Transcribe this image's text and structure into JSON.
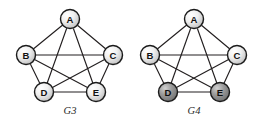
{
  "figure": {
    "background_color": "#ffffff",
    "edge_color": "#231f20",
    "node_outline_color": "#1a1a1a",
    "node_fill_light": "#f2f2f2",
    "node_fill_dark": "#8c8c8c",
    "node_highlight_color": "#ffffff"
  },
  "graphs": [
    {
      "id": "g3",
      "caption": "G3",
      "node_labels": [
        "A",
        "B",
        "C",
        "D",
        "E"
      ],
      "nodes": [
        {
          "id": "A",
          "label": "A",
          "cx": 70,
          "cy": 19,
          "r": 9.5,
          "shade": "light"
        },
        {
          "id": "B",
          "label": "B",
          "cx": 26,
          "cy": 55,
          "r": 9.5,
          "shade": "light"
        },
        {
          "id": "C",
          "label": "C",
          "cx": 113,
          "cy": 55,
          "r": 9.5,
          "shade": "light"
        },
        {
          "id": "D",
          "label": "D",
          "cx": 44,
          "cy": 92,
          "r": 9.5,
          "shade": "light"
        },
        {
          "id": "E",
          "label": "E",
          "cx": 96,
          "cy": 92,
          "r": 9.5,
          "shade": "light"
        }
      ],
      "edges": [
        {
          "from": "A",
          "to": "B"
        },
        {
          "from": "A",
          "to": "C"
        },
        {
          "from": "A",
          "to": "D"
        },
        {
          "from": "A",
          "to": "E"
        },
        {
          "from": "B",
          "to": "C"
        },
        {
          "from": "B",
          "to": "D"
        },
        {
          "from": "B",
          "to": "E"
        },
        {
          "from": "C",
          "to": "D"
        },
        {
          "from": "C",
          "to": "E"
        },
        {
          "from": "D",
          "to": "E"
        }
      ],
      "edge_count": 10,
      "caption_x": 70,
      "caption_y": 110
    },
    {
      "id": "g4",
      "caption": "G4",
      "node_labels": [
        "A",
        "B",
        "C",
        "D",
        "E"
      ],
      "nodes": [
        {
          "id": "A",
          "label": "A",
          "cx": 63,
          "cy": 19,
          "r": 9.5,
          "shade": "light"
        },
        {
          "id": "B",
          "label": "B",
          "cx": 19,
          "cy": 55,
          "r": 9.5,
          "shade": "light"
        },
        {
          "id": "C",
          "label": "C",
          "cx": 106,
          "cy": 55,
          "r": 9.5,
          "shade": "light"
        },
        {
          "id": "D",
          "label": "D",
          "cx": 37,
          "cy": 92,
          "r": 9.5,
          "shade": "dark"
        },
        {
          "id": "E",
          "label": "E",
          "cx": 89,
          "cy": 92,
          "r": 9.5,
          "shade": "dark"
        }
      ],
      "edges": [
        {
          "from": "A",
          "to": "B"
        },
        {
          "from": "A",
          "to": "C"
        },
        {
          "from": "A",
          "to": "D"
        },
        {
          "from": "A",
          "to": "E"
        },
        {
          "from": "B",
          "to": "C"
        },
        {
          "from": "B",
          "to": "D"
        },
        {
          "from": "B",
          "to": "E"
        },
        {
          "from": "C",
          "to": "D"
        },
        {
          "from": "C",
          "to": "E"
        },
        {
          "from": "D",
          "to": "E"
        }
      ],
      "edge_count": 10,
      "caption_x": 63,
      "caption_y": 110
    }
  ]
}
